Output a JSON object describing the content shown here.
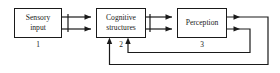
{
  "diagram": {
    "background_color": "#ffffff",
    "line_color": "#1a1a1a",
    "nodes": [
      {
        "id": "sensory-input",
        "index_label": "1",
        "label_lines": [
          "Sensory",
          "input"
        ],
        "line1": "Sensory",
        "line2": "input"
      },
      {
        "id": "cognitive-structures",
        "index_label": "2",
        "label_lines": [
          "Cognitive",
          "structures"
        ],
        "line1": "Cognitive",
        "line2": "structures"
      },
      {
        "id": "perception",
        "index_label": "3",
        "label_lines": [
          "Perception"
        ],
        "line1": "Perception",
        "line2": ""
      }
    ],
    "connectors": [
      {
        "id": "sensory-to-cognitive-upper",
        "from": "sensory-input",
        "to": "cognitive-structures",
        "direction": "right"
      },
      {
        "id": "sensory-to-cognitive-lower",
        "from": "sensory-input",
        "to": "cognitive-structures",
        "direction": "right"
      },
      {
        "id": "cognitive-to-perception-upper",
        "from": "cognitive-structures",
        "to": "perception",
        "direction": "right"
      },
      {
        "id": "cognitive-to-perception-lower",
        "from": "cognitive-structures",
        "to": "perception",
        "direction": "right"
      },
      {
        "id": "perception-feedback-outer",
        "from": "perception",
        "to": "cognitive-structures",
        "direction": "up"
      },
      {
        "id": "perception-feedback-inner",
        "from": "perception",
        "to": "cognitive-structures",
        "direction": "up"
      }
    ]
  }
}
